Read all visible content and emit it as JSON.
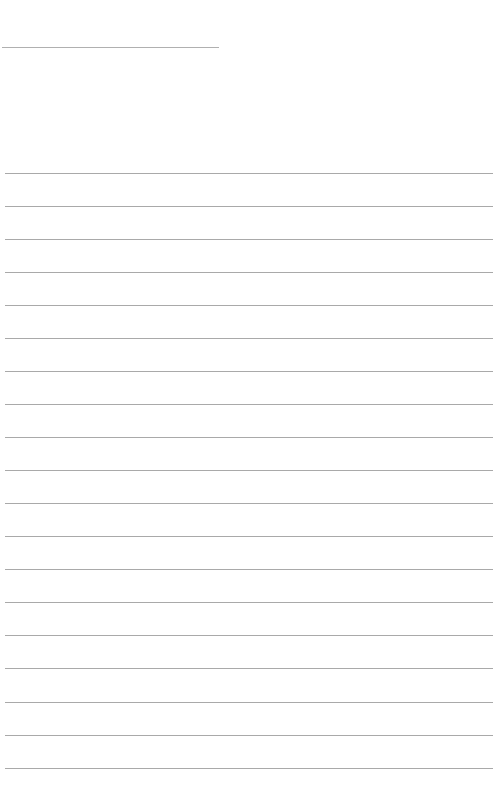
{
  "page": {
    "type": "lined-paper",
    "background": "#ffffff",
    "line_color": "#a9a9a9",
    "header_line": {
      "y": 47,
      "x_start": 2,
      "x_end": 219
    },
    "ruled_lines": {
      "count": 19,
      "first_y": 172.7,
      "spacing": 33.05,
      "x_start": 5,
      "x_end": 493
    },
    "text": ""
  }
}
